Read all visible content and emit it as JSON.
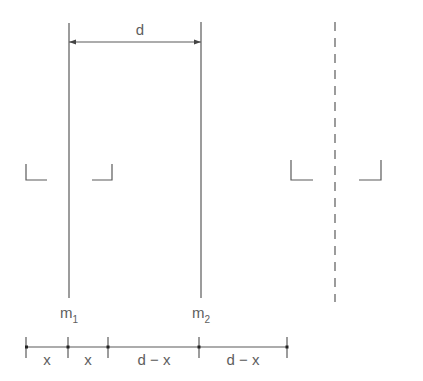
{
  "diagram": {
    "type": "two-mirror / two-mass separation schematic",
    "colors": {
      "line": "#5a5a5a",
      "text": "#5e5e5e",
      "background": "#ffffff"
    },
    "top_dimension": {
      "label": "d",
      "from_x": 69,
      "to_x": 201,
      "y": 42
    },
    "verticals": [
      {
        "name": "m1",
        "x": 69,
        "y1": 23,
        "y2": 298,
        "label_main": "m",
        "label_sub": "1"
      },
      {
        "name": "m2",
        "x": 201,
        "y1": 22,
        "y2": 298,
        "label_main": "m",
        "label_sub": "2"
      }
    ],
    "mirror_line": {
      "x": 335,
      "y1": 22,
      "y2": 302,
      "style": "dashed"
    },
    "brackets": [
      {
        "name": "left-bracket-a",
        "side": "left",
        "vx": 26,
        "hx2": 47,
        "y_top": 164,
        "y_bottom": 180
      },
      {
        "name": "left-bracket-b",
        "side": "right",
        "vx": 112,
        "hx1": 92,
        "y_top": 164,
        "y_bottom": 180
      },
      {
        "name": "right-bracket-a",
        "side": "left",
        "vx": 291,
        "hx2": 313,
        "y_top": 160,
        "y_bottom": 180
      },
      {
        "name": "right-bracket-b",
        "side": "right",
        "vx": 381,
        "hx1": 359,
        "y_top": 160,
        "y_bottom": 180
      }
    ],
    "bottom_dimension": {
      "y": 347,
      "ticks": [
        26,
        68,
        108,
        199,
        287
      ],
      "segments": [
        {
          "label": "x",
          "from": 26,
          "to": 68
        },
        {
          "label": "x",
          "from": 68,
          "to": 108
        },
        {
          "label": "d − x",
          "from": 108,
          "to": 199
        },
        {
          "label": "d − x",
          "from": 199,
          "to": 287
        }
      ]
    }
  }
}
